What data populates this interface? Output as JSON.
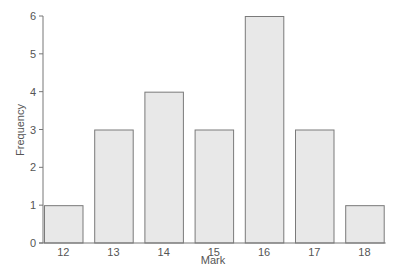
{
  "chart_data": {
    "type": "bar",
    "title": "",
    "xlabel": "Mark",
    "ylabel": "Frequency",
    "categories": [
      "12",
      "13",
      "14",
      "15",
      "16",
      "17",
      "18"
    ],
    "values": [
      1,
      3,
      4,
      3,
      6,
      3,
      1
    ],
    "ylim": [
      0,
      6
    ],
    "yticks": [
      0,
      1,
      2,
      3,
      4,
      5,
      6
    ],
    "grid": false,
    "legend": "none",
    "colors": {
      "bar_fill": "#e8e8e8",
      "bar_stroke": "#7a7a7a",
      "axis": "#777777",
      "text": "#555555"
    }
  }
}
